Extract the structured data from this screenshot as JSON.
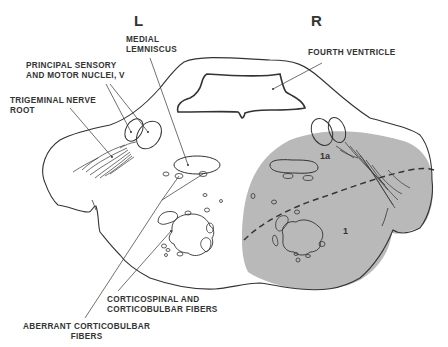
{
  "sides": {
    "left": "L",
    "right": "R"
  },
  "labels": {
    "medial_lemniscus": [
      "MEDIAL",
      "LEMNISCUS"
    ],
    "principal_nuclei": [
      "PRINCIPAL SENSORY",
      "AND MOTOR NUCLEI, V"
    ],
    "trigeminal_root": [
      "TRIGEMINAL NERVE",
      "ROOT"
    ],
    "fourth_ventricle": "FOURTH VENTRICLE",
    "corticospinal": [
      "CORTICOSPINAL AND",
      "CORTICOBULBAR FIBERS"
    ],
    "aberrant": [
      "ABERRANT CORTICOBULBAR",
      "FIBERS"
    ]
  },
  "regions": {
    "region_1a": "1a",
    "region_1": "1"
  },
  "colors": {
    "shading": "#b9b9b9",
    "line": "#333333",
    "background": "#ffffff"
  }
}
